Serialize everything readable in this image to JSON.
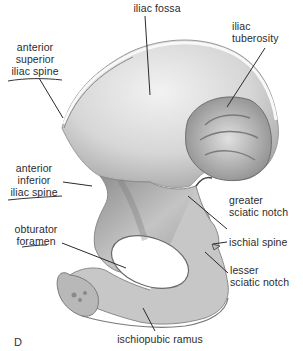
{
  "figure": {
    "panel_letter": "D",
    "labels": {
      "iliac_fossa": "iliac fossa",
      "iliac_tuberosity": "iliac\ntuberosity",
      "anterior_superior_iliac_spine": "anterior\nsuperior\niliac spine",
      "anterior_inferior_iliac_spine": "anterior\ninferior\niliac spine",
      "greater_sciatic_notch": "greater\nsciatic notch",
      "obturator_foramen": "obturator\nforamen",
      "ischial_spine": "ischial spine",
      "lesser_sciatic_notch": "lesser\nsciatic notch",
      "ischiopubic_ramus": "ischiopubic ramus"
    },
    "colors": {
      "background": "#ffffff",
      "bone_light": "#e6e6e6",
      "bone_mid": "#bdbdbd",
      "bone_dark": "#7a7a7a",
      "leader_line": "#2a2a2a",
      "text": "#2b2b2b"
    }
  }
}
